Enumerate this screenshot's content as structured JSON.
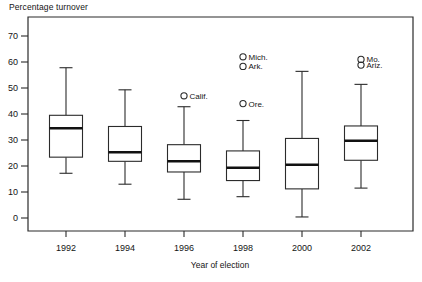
{
  "chart_data": {
    "type": "box",
    "title": "",
    "ylabel": "Percentage turnover",
    "xlabel": "Year of election",
    "categories": [
      "1992",
      "1994",
      "1996",
      "1998",
      "2000",
      "2002"
    ],
    "ylim": [
      0,
      75
    ],
    "yticks": [
      0,
      10,
      20,
      30,
      40,
      50,
      60,
      70
    ],
    "ytick_labels": [
      "0",
      "10",
      "20",
      "30",
      "40",
      "50",
      "60",
      "70"
    ],
    "grid": false,
    "legend": "none",
    "boxes": [
      {
        "category": "1992",
        "whisker_low": 17.2,
        "q1": 23.4,
        "median": 34.5,
        "q3": 39.5,
        "whisker_high": 57.8,
        "outliers": []
      },
      {
        "category": "1994",
        "whisker_low": 13.0,
        "q1": 21.8,
        "median": 25.3,
        "q3": 35.2,
        "whisker_high": 49.3,
        "outliers": []
      },
      {
        "category": "1996",
        "whisker_low": 7.2,
        "q1": 17.7,
        "median": 21.8,
        "q3": 28.2,
        "whisker_high": 42.8,
        "outliers": [
          {
            "label": "Calif.",
            "value": 47.0
          }
        ]
      },
      {
        "category": "1998",
        "whisker_low": 8.2,
        "q1": 14.4,
        "median": 19.3,
        "q3": 25.8,
        "whisker_high": 37.5,
        "outliers": [
          {
            "label": "Mich.",
            "value": 62.0
          },
          {
            "label": "Ark.",
            "value": 58.3
          },
          {
            "label": "Ore.",
            "value": 44.0
          }
        ]
      },
      {
        "category": "2000",
        "whisker_low": 0.4,
        "q1": 11.2,
        "median": 20.5,
        "q3": 30.6,
        "whisker_high": 56.4,
        "outliers": []
      },
      {
        "category": "2002",
        "whisker_low": 11.5,
        "q1": 22.2,
        "median": 29.7,
        "q3": 35.4,
        "whisker_high": 51.4,
        "outliers": [
          {
            "label": "Mo.",
            "value": 61.0
          },
          {
            "label": "Ariz.",
            "value": 58.8
          }
        ]
      }
    ],
    "colors": {
      "line": "#2b2b2b",
      "median": "#111111",
      "box_fill": "#ffffff",
      "background": "#ffffff",
      "text": "#141414"
    }
  }
}
